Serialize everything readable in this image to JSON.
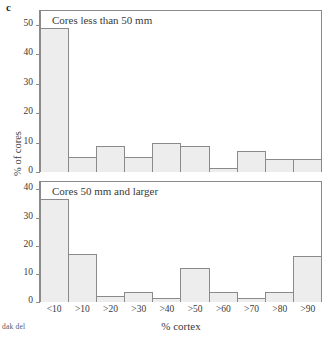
{
  "figure": {
    "panel_letter": "c",
    "credit": "dak del",
    "ylabel": "% of cores",
    "xlabel": "% cortex"
  },
  "chart_data": {
    "type": "bar",
    "title": "",
    "xlabel": "% cortex",
    "ylabel": "% of cores",
    "grid": false,
    "legend": "none",
    "categories": [
      "<10",
      ">10",
      ">20",
      ">30",
      ">40",
      ">50",
      ">60",
      ">70",
      ">80",
      ">90"
    ],
    "panels": [
      {
        "name": "Cores less than 50 mm",
        "ylim": [
          0,
          55
        ],
        "yticks": [
          0,
          10,
          20,
          30,
          40,
          50
        ],
        "values": [
          49,
          5,
          9,
          5,
          10,
          9,
          1.5,
          7,
          4.5,
          4.5
        ]
      },
      {
        "name": "Cores 50 mm and larger",
        "ylim": [
          0,
          43
        ],
        "yticks": [
          0,
          10,
          20,
          30,
          40
        ],
        "values": [
          36.5,
          17,
          2,
          3.5,
          1.5,
          12,
          3.5,
          1.5,
          3.5,
          16.5
        ]
      }
    ]
  }
}
